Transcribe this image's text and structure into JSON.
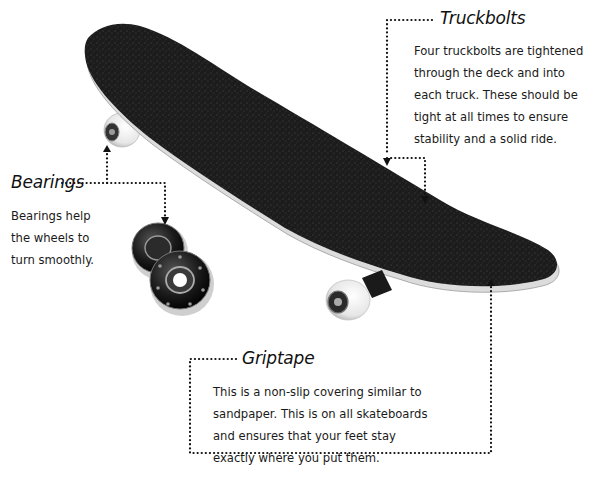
{
  "diagram": {
    "colors": {
      "griptape": "#1c1c1c",
      "deck_edge": "#d9d9d9",
      "wheel": "#efefef",
      "leader_line": "#111111",
      "background": "#ffffff"
    },
    "callouts": {
      "truckbolts": {
        "title": "Truckbolts",
        "lines": [
          "Four truckbolts are tightened",
          "through the deck and into",
          "each truck. These should be",
          "tight at all times to ensure",
          "stability and a solid ride."
        ]
      },
      "bearings": {
        "title": "Bearings",
        "lines": [
          "Bearings help",
          "the wheels to",
          "turn smoothly."
        ]
      },
      "griptape": {
        "title": "Griptape",
        "lines": [
          "This is a non-slip covering similar to",
          "sandpaper. This is on all skateboards",
          "and ensures that your feet stay",
          "exactly where you put them."
        ]
      }
    },
    "parts": [
      "deck",
      "griptape",
      "front-wheel",
      "rear-wheel",
      "truck",
      "bearings",
      "truckbolts"
    ]
  }
}
